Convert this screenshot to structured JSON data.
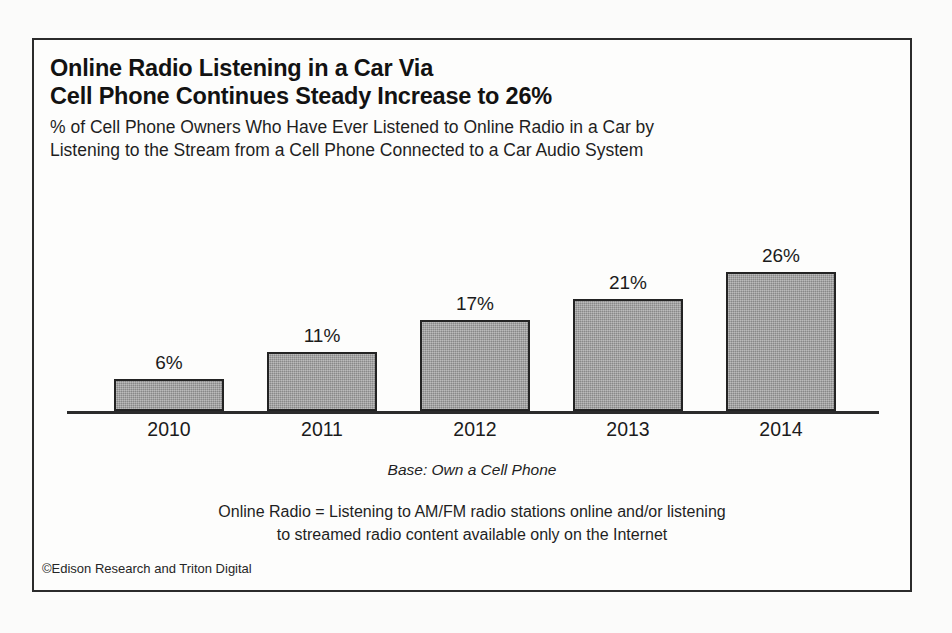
{
  "chart_data": {
    "type": "bar",
    "title": "Online Radio Listening in a Car Via Cell Phone Continues Steady Increase to 26%",
    "title_lines": [
      "Online Radio Listening in a Car Via",
      "Cell Phone Continues Steady Increase to 26%"
    ],
    "subtitle": "% of Cell Phone Owners Who Have Ever Listened to Online Radio in a Car by Listening to the Stream from a Cell Phone Connected to a Car Audio System",
    "subtitle_lines": [
      "% of Cell Phone Owners Who Have Ever Listened to Online Radio in a Car by",
      "Listening to the Stream from a Cell Phone Connected to a Car Audio System"
    ],
    "categories": [
      "2010",
      "2011",
      "2012",
      "2013",
      "2014"
    ],
    "values": [
      6,
      11,
      17,
      21,
      26
    ],
    "value_labels": [
      "6%",
      "11%",
      "17%",
      "21%",
      "26%"
    ],
    "xlabel": "",
    "ylabel": "",
    "ylim": [
      0,
      30
    ],
    "grid": false,
    "legend": "none",
    "bar_fill_color": "#9a9a9a",
    "bar_border_color": "#232323",
    "axis_color": "#2b2b2b",
    "base_note": "Base: Own a Cell Phone",
    "definition_lines": [
      "Online Radio = Listening to AM/FM radio stations online and/or listening",
      "to streamed radio content available only on the Internet"
    ],
    "copyright": "©Edison Research and Triton Digital"
  }
}
